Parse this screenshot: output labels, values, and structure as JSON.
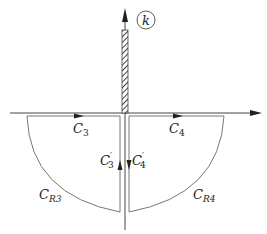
{
  "diagram": {
    "axis_label": "k",
    "labels": {
      "c3": {
        "main": "C",
        "sub": "3"
      },
      "c4": {
        "main": "C",
        "sub": "4"
      },
      "c3p": {
        "main": "C",
        "prime": "′",
        "sub": "3"
      },
      "c4p": {
        "main": "C",
        "prime": "′",
        "sub": "4"
      },
      "cr3": {
        "main": "C",
        "sub": "R3"
      },
      "cr4": {
        "main": "C",
        "sub": "R4"
      }
    },
    "colors": {
      "line": "#555555",
      "contour": "#777777",
      "text": "#222222"
    }
  }
}
